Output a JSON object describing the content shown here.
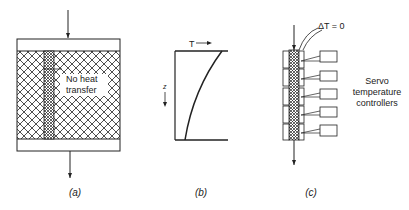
{
  "panels": {
    "a": {
      "caption": "(a)",
      "annotation_line1": "No heat",
      "annotation_line2": "transfer"
    },
    "b": {
      "caption": "(b)",
      "x_axis_label": "T",
      "y_axis_label": "z"
    },
    "c": {
      "caption": "(c)",
      "delta_label": "ΔT = 0",
      "controller_label_line1": "Servo",
      "controller_label_line2": "temperature",
      "controller_label_line3": "controllers",
      "controller_count": 5
    }
  },
  "colors": {
    "ink": "#222222",
    "background": "#ffffff"
  }
}
